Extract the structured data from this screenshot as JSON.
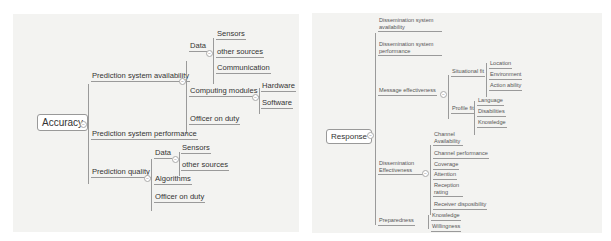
{
  "left_map": {
    "root": "Accuracy",
    "branches": [
      {
        "label": "Prediction system availability",
        "children": [
          {
            "label": "Data",
            "children": [
              {
                "label": "Sensors"
              },
              {
                "label": "other sources"
              },
              {
                "label": "Communication"
              }
            ]
          },
          {
            "label": "Computing modules",
            "children": [
              {
                "label": "Hardware"
              },
              {
                "label": "Software"
              }
            ]
          },
          {
            "label": "Officer on duty"
          }
        ]
      },
      {
        "label": "Prediction system performance"
      },
      {
        "label": "Prediction quality",
        "children": [
          {
            "label": "Data",
            "children": [
              {
                "label": "Sensors"
              },
              {
                "label": "other sources"
              }
            ]
          },
          {
            "label": "Algorithms"
          },
          {
            "label": "Officer on duty"
          }
        ]
      }
    ]
  },
  "right_map": {
    "root": "Response",
    "branches": [
      {
        "label": "Dissemination system availability"
      },
      {
        "label": "Dissemination system performance"
      },
      {
        "label": "Message effectiveness",
        "children": [
          {
            "label": "Situational fit",
            "children": [
              {
                "label": "Location"
              },
              {
                "label": "Environment"
              },
              {
                "label": "Action ability"
              }
            ]
          },
          {
            "label": "Profile fit",
            "children": [
              {
                "label": "Language"
              },
              {
                "label": "Disabilities"
              },
              {
                "label": "Knowledge"
              }
            ]
          }
        ]
      },
      {
        "label": "Dissemination Effectiveness",
        "children": [
          {
            "label": "Channel Availability"
          },
          {
            "label": "Channel performance"
          },
          {
            "label": "Coverage"
          },
          {
            "label": "Attention"
          },
          {
            "label": "Reception rating"
          },
          {
            "label": "Receiver disposibility"
          }
        ]
      },
      {
        "label": "Preparedness",
        "children": [
          {
            "label": "Knowledge"
          },
          {
            "label": "Willingness"
          }
        ]
      }
    ]
  },
  "toggle_symbol": "−"
}
